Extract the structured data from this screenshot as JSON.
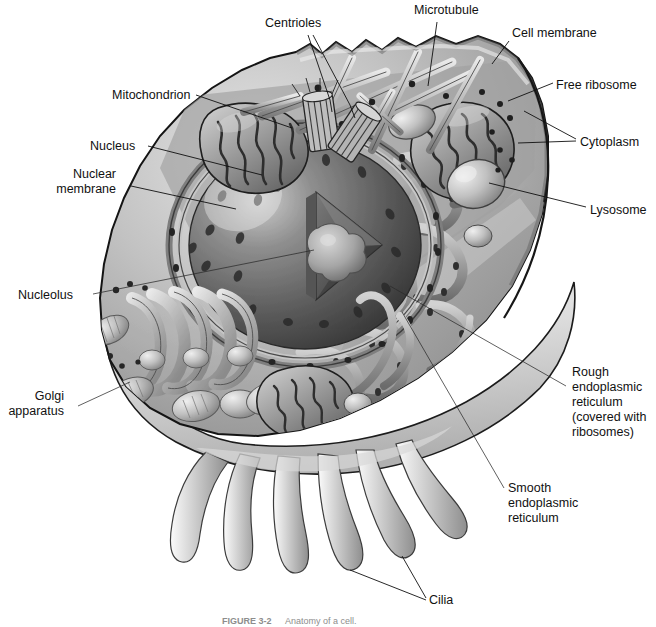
{
  "figure": {
    "type": "biology-diagram",
    "palette": {
      "background": "#ffffff",
      "label_text": "#111111",
      "leader_line": "#101010",
      "cytoplasm_light": "#d9d9d9",
      "cytoplasm_mid": "#a8a8a8",
      "cytoplasm_dark": "#6e6e6e",
      "membrane_outline": "#1c1c1c",
      "nucleus_light": "#9a9a9a",
      "nucleus_dark": "#4a4a4a",
      "nucleolus": "#b3b3b3",
      "caption_text": "#8d8d8d"
    },
    "caption": {
      "figure_number": "FIGURE 3-2",
      "text": "Anatomy of a cell."
    },
    "labels": [
      {
        "id": "centrioles",
        "text": "Centrioles",
        "x": 265,
        "y": 27,
        "anchor": "start",
        "lines": [
          [
            [
              308,
              35
            ],
            [
              330,
              100
            ],
            [
              332,
              112
            ]
          ],
          [
            [
              313,
              35
            ],
            [
              350,
              105
            ],
            [
              355,
              118
            ]
          ]
        ]
      },
      {
        "id": "microtubule",
        "text": "Microtubule",
        "x": 414,
        "y": 14,
        "anchor": "start",
        "lines": [
          [
            [
              437,
              22
            ],
            [
              428,
              82
            ]
          ]
        ]
      },
      {
        "id": "cell-membrane",
        "text": "Cell membrane",
        "x": 512,
        "y": 37,
        "anchor": "start",
        "lines": [
          [
            [
              509,
              41
            ],
            [
              494,
              62
            ]
          ]
        ]
      },
      {
        "id": "free-ribosome",
        "text": "Free ribosome",
        "x": 556,
        "y": 85,
        "anchor": "start",
        "lines": [
          [
            [
              553,
              85
            ],
            [
              510,
              102
            ]
          ]
        ]
      },
      {
        "id": "cytoplasm",
        "text": "Cytoplasm",
        "x": 580,
        "y": 144,
        "anchor": "start",
        "lines": [
          [
            [
              576,
              140
            ],
            [
              524,
              112
            ]
          ],
          [
            [
              576,
              142
            ],
            [
              520,
              143
            ]
          ]
        ]
      },
      {
        "id": "lysosome",
        "text": "Lysosome",
        "x": 590,
        "y": 212,
        "anchor": "start",
        "lines": [
          [
            [
              586,
              208
            ],
            [
              488,
              183
            ]
          ]
        ]
      },
      {
        "id": "mitochondrion",
        "text": "Mitochondrion",
        "x": 112,
        "y": 99,
        "anchor": "start",
        "lines": [
          [
            [
              196,
              95
            ],
            [
              290,
              127
            ]
          ]
        ]
      },
      {
        "id": "nucleus",
        "text": "Nucleus",
        "x": 90,
        "y": 150,
        "anchor": "start",
        "lines": [
          [
            [
              147,
              146
            ],
            [
              258,
              173
            ]
          ]
        ]
      },
      {
        "id": "nuclear-membrane",
        "text": "Nuclear\nmembrane",
        "line1": "Nuclear",
        "line2": "membrane",
        "x": 47,
        "y": 178,
        "anchor": "start",
        "lines": [
          [
            [
              130,
              186
            ],
            [
              232,
              207
            ]
          ]
        ]
      },
      {
        "id": "nucleolus",
        "text": "Nucleolus",
        "x": 18,
        "y": 299,
        "anchor": "start",
        "lines": [
          [
            [
              93,
              294
            ],
            [
              310,
              250
            ]
          ]
        ]
      },
      {
        "id": "golgi-apparatus",
        "text": "Golgi\napparatus",
        "line1": "Golgi",
        "line2": "apparatus",
        "x": 14,
        "y": 400,
        "anchor": "start",
        "lines": [
          [
            [
              75,
              407
            ],
            [
              128,
              384
            ]
          ]
        ]
      },
      {
        "id": "rough-endoplasmic-reticulum",
        "text": "Rough endoplasmic reticulum (covered with ribosomes)",
        "line1": "Rough",
        "line2": "endoplasmic",
        "line3": "reticulum",
        "line4": "(covered with",
        "line5": "ribosomes)",
        "x": 572,
        "y": 378,
        "anchor": "start",
        "lines": [
          [
            [
              568,
              386
            ],
            [
              388,
              285
            ]
          ]
        ]
      },
      {
        "id": "smooth-endoplasmic-reticulum",
        "text": "Smooth endoplasmic reticulum",
        "line1": "Smooth",
        "line2": "endoplasmic",
        "line3": "reticulum",
        "x": 508,
        "y": 494,
        "anchor": "start",
        "lines": [
          [
            [
              504,
              489
            ],
            [
              400,
              310
            ]
          ]
        ]
      },
      {
        "id": "cilia",
        "text": "Cilia",
        "x": 429,
        "y": 604,
        "anchor": "start",
        "lines": [
          [
            [
              426,
              600
            ],
            [
              352,
              570
            ]
          ],
          [
            [
              426,
              598
            ],
            [
              400,
              556
            ]
          ]
        ]
      }
    ]
  }
}
